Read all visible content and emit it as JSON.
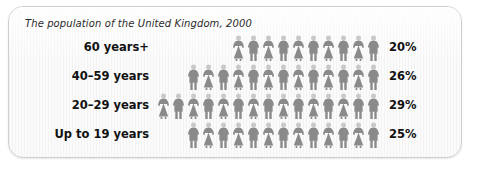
{
  "chart_data": {
    "type": "bar",
    "subtype": "pictogram",
    "title": "The population of the United Kingdom, 2000",
    "xlabel": "",
    "ylabel": "",
    "categories": [
      "60 years+",
      "40–59 years",
      "20–29 years",
      "Up to 19 years"
    ],
    "values": [
      20,
      26,
      29,
      25
    ],
    "value_labels": [
      "20%",
      "26%",
      "29%",
      "25%"
    ],
    "unit": "%",
    "icon_counts": [
      10,
      13,
      15,
      13
    ],
    "icon_semantic": "person-icon",
    "icon_value_each": 2,
    "legend": [],
    "grid": false,
    "annotations": []
  },
  "chart": {
    "title": "The population of the United Kingdom, 2000",
    "rows": [
      {
        "label": "60 years+",
        "value_label": "20%",
        "value": 20,
        "icon_count": 10,
        "icons": [
          "female",
          "male",
          "female",
          "male",
          "female",
          "male",
          "female",
          "male",
          "female",
          "male"
        ]
      },
      {
        "label": "40–59 years",
        "value_label": "26%",
        "value": 26,
        "icon_count": 13,
        "icons": [
          "male",
          "female",
          "male",
          "female",
          "male",
          "female",
          "male",
          "female",
          "male",
          "female",
          "male",
          "female",
          "male"
        ]
      },
      {
        "label": "20–29 years",
        "value_label": "29%",
        "value": 29,
        "icon_count": 15,
        "icons": [
          "female",
          "male",
          "female",
          "male",
          "female",
          "male",
          "female",
          "male",
          "female",
          "male",
          "female",
          "male",
          "female",
          "male",
          "male"
        ]
      },
      {
        "label": "Up to 19 years",
        "value_label": "25%",
        "value": 25,
        "icon_count": 13,
        "icons": [
          "male",
          "female",
          "male",
          "female",
          "male",
          "female",
          "male",
          "female",
          "male",
          "female",
          "male",
          "female",
          "male"
        ]
      }
    ]
  },
  "colors": {
    "panel_background": "#f7f7f7",
    "panel_border": "#cfcfcf",
    "text": "#111111",
    "title_text": "#2b2b2b",
    "figure_body": "#8a8a8a",
    "figure_head": "#c9c9c9"
  }
}
